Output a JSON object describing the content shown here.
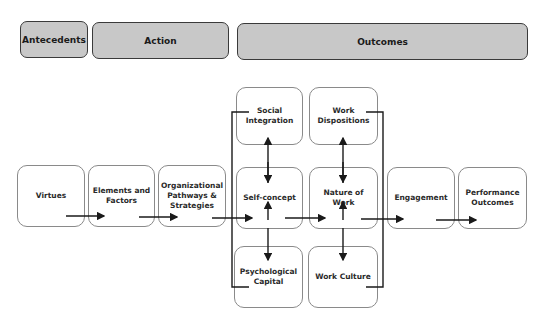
{
  "headers": {
    "antecedents": "Antecedents",
    "action": "Action",
    "outcomes": "Outcomes"
  },
  "nodes": {
    "virtues": "Virtues",
    "elements_factors": "Elements and\nFactors",
    "org_pathways": "Organizational\nPathways &\nStrategies",
    "social_integration": "Social\nIntegration",
    "self_concept": "Self-concept",
    "psychological_capital": "Psychological\nCapital",
    "work_dispositions": "Work\nDispositions",
    "nature_of_work": "Nature of\nWork",
    "work_culture": "Work Culture",
    "engagement": "Engagement",
    "performance_outcomes": "Performance\nOutcomes"
  },
  "colors": {
    "header_fill": "#c8c8c8",
    "header_border": "#3a3a3a",
    "node_border": "#8a8a8a",
    "arrow": "#1a1a1a"
  }
}
